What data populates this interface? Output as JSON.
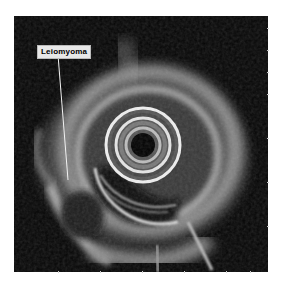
{
  "image": {
    "type": "endoscopic ultrasound (radial EUS)",
    "background_color": "#ffffff",
    "scan_background_color": "#050505"
  },
  "annotations": [
    {
      "label": "Leiomyoma",
      "pointer": {
        "from": [
          58,
          55
        ],
        "to": [
          68,
          180
        ]
      }
    }
  ],
  "scan": {
    "center": [
      143,
      145
    ],
    "core_radius": 12,
    "ring_radii": [
      17,
      24,
      30,
      37
    ]
  }
}
